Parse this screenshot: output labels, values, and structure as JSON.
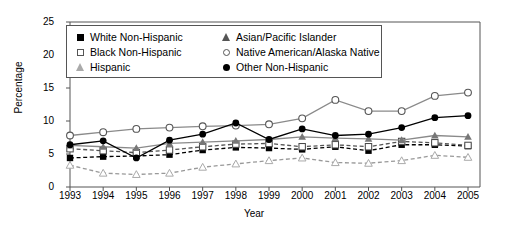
{
  "chart_data": {
    "type": "line",
    "title": "",
    "xlabel": "Year",
    "ylabel": "Percentage",
    "categories": [
      1993,
      1994,
      1995,
      1996,
      1997,
      1998,
      1999,
      2000,
      2001,
      2002,
      2003,
      2004,
      2005
    ],
    "ylim": [
      0,
      25
    ],
    "yticks": [
      0,
      5,
      10,
      15,
      20,
      25
    ],
    "grid": false,
    "legend_position": "top-left-inside",
    "series": [
      {
        "name": "White Non-Hispanic",
        "marker": "filled-square",
        "line": "dashed",
        "color": "#000000",
        "values": [
          4.4,
          4.6,
          4.7,
          4.9,
          5.6,
          6.0,
          5.9,
          5.7,
          6.1,
          5.5,
          6.4,
          6.4,
          6.2
        ]
      },
      {
        "name": "Black Non-Hispanic",
        "marker": "open-square",
        "line": "dashed",
        "color": "#555555",
        "values": [
          5.8,
          5.5,
          5.2,
          5.6,
          6.1,
          6.5,
          6.6,
          6.1,
          6.4,
          6.1,
          6.9,
          6.7,
          6.3
        ]
      },
      {
        "name": "Hispanic",
        "marker": "open-triangle",
        "line": "dashed",
        "color": "#999999",
        "values": [
          3.3,
          2.1,
          1.9,
          2.1,
          3.0,
          3.5,
          4.0,
          4.4,
          3.7,
          3.6,
          4.0,
          4.8,
          4.5
        ]
      },
      {
        "name": "Asian/Pacific Islander",
        "marker": "filled-triangle",
        "line": "solid",
        "color": "#8a8a8a",
        "values": [
          6.3,
          6.1,
          5.9,
          6.6,
          6.8,
          7.0,
          7.2,
          7.6,
          7.4,
          7.3,
          7.1,
          7.8,
          7.6
        ]
      },
      {
        "name": "Native American/Alaska Native",
        "marker": "open-circle",
        "line": "solid",
        "color": "#8a8a8a",
        "values": [
          7.8,
          8.3,
          8.8,
          9.0,
          9.2,
          9.3,
          9.5,
          10.4,
          13.2,
          11.5,
          11.5,
          13.8,
          14.3
        ]
      },
      {
        "name": "Other Non-Hispanic",
        "marker": "filled-circle",
        "line": "solid",
        "color": "#000000",
        "values": [
          6.4,
          7.0,
          4.4,
          7.1,
          8.0,
          9.7,
          7.2,
          8.8,
          7.8,
          8.0,
          9.0,
          10.5,
          10.8
        ]
      }
    ]
  },
  "legend": {
    "col1": [
      {
        "label": "White Non-Hispanic",
        "marker": "filled-square"
      },
      {
        "label": "Black Non-Hispanic",
        "marker": "open-square"
      },
      {
        "label": "Hispanic",
        "marker": "open-triangle"
      }
    ],
    "col2": [
      {
        "label": "Asian/Pacific Islander",
        "marker": "filled-triangle"
      },
      {
        "label": "Native American/Alaska Native",
        "marker": "open-circle"
      },
      {
        "label": "Other Non-Hispanic",
        "marker": "filled-circle"
      }
    ]
  }
}
